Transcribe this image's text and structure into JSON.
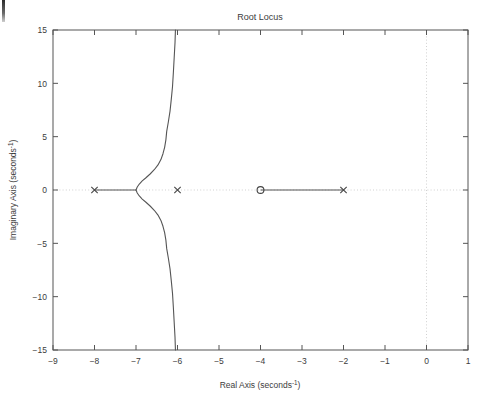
{
  "chart_data": {
    "type": "line",
    "title": "Root Locus",
    "xlabel": "Real Axis (seconds⁻¹)",
    "ylabel": "Imaginary Axis (seconds⁻¹)",
    "xlim": [
      -9,
      1
    ],
    "ylim": [
      -15,
      15
    ],
    "xticks": [
      -9,
      -8,
      -7,
      -6,
      -5,
      -4,
      -3,
      -2,
      -1,
      0,
      1
    ],
    "xticklabels": [
      "-9",
      "-8",
      "-7",
      "-6",
      "-5",
      "-4",
      "-3",
      "-2",
      "-1",
      "0",
      "1"
    ],
    "yticks": [
      -15,
      -10,
      -5,
      0,
      5,
      10,
      15
    ],
    "yticklabels": [
      "-15",
      "-10",
      "-5",
      "0",
      "5",
      "10",
      "15"
    ],
    "grid": false,
    "zero_axis_lines": true,
    "legend": null,
    "line_color": "#555555",
    "marker_color": "#444444",
    "axis_color": "#555555",
    "gridline_color": "#cccccc",
    "poles": [
      {
        "marker": "x",
        "real": -8,
        "imag": 0
      },
      {
        "marker": "x",
        "real": -6,
        "imag": 0
      },
      {
        "marker": "x",
        "real": -2,
        "imag": 0
      }
    ],
    "zeros": [
      {
        "marker": "o",
        "real": -4,
        "imag": 0
      }
    ],
    "breakaway_point": {
      "real": -7,
      "imag": 0
    },
    "real_axis_segments": [
      {
        "from": -8,
        "to": -7
      },
      {
        "from": -4,
        "to": -2
      }
    ],
    "series": [
      {
        "name": "upper-branch",
        "points": [
          [
            -7.0,
            0.0
          ],
          [
            -6.97,
            0.28
          ],
          [
            -6.92,
            0.56
          ],
          [
            -6.85,
            0.85
          ],
          [
            -6.76,
            1.15
          ],
          [
            -6.66,
            1.5
          ],
          [
            -6.56,
            1.9
          ],
          [
            -6.47,
            2.35
          ],
          [
            -6.4,
            2.85
          ],
          [
            -6.35,
            3.4
          ],
          [
            -6.31,
            4.0
          ],
          [
            -6.28,
            4.7
          ],
          [
            -6.26,
            5.5
          ],
          [
            -6.22,
            6.4
          ],
          [
            -6.18,
            7.4
          ],
          [
            -6.15,
            8.5
          ],
          [
            -6.12,
            9.7
          ],
          [
            -6.1,
            11.0
          ],
          [
            -6.08,
            12.4
          ],
          [
            -6.06,
            13.8
          ],
          [
            -6.05,
            15.0
          ]
        ]
      },
      {
        "name": "lower-branch",
        "points": [
          [
            -7.0,
            0.0
          ],
          [
            -6.97,
            -0.28
          ],
          [
            -6.92,
            -0.56
          ],
          [
            -6.85,
            -0.85
          ],
          [
            -6.76,
            -1.15
          ],
          [
            -6.66,
            -1.5
          ],
          [
            -6.56,
            -1.9
          ],
          [
            -6.47,
            -2.35
          ],
          [
            -6.4,
            -2.85
          ],
          [
            -6.35,
            -3.4
          ],
          [
            -6.31,
            -4.0
          ],
          [
            -6.28,
            -4.7
          ],
          [
            -6.26,
            -5.5
          ],
          [
            -6.22,
            -6.4
          ],
          [
            -6.18,
            -7.4
          ],
          [
            -6.15,
            -8.5
          ],
          [
            -6.12,
            -9.7
          ],
          [
            -6.1,
            -11.0
          ],
          [
            -6.08,
            -12.4
          ],
          [
            -6.06,
            -13.8
          ],
          [
            -6.05,
            -15.0
          ]
        ]
      }
    ]
  },
  "plot": {
    "title": "Root Locus",
    "xlabel_text": "Real Axis (seconds",
    "xlabel_sup": "-1",
    "xlabel_tail": ")",
    "ylabel_text": "Imaginary Axis (seconds",
    "ylabel_sup": "-1",
    "ylabel_tail": ")"
  }
}
